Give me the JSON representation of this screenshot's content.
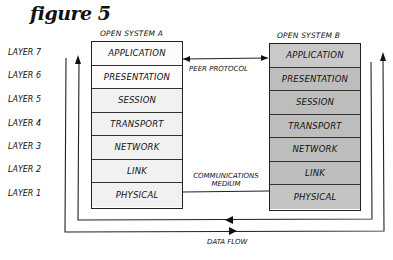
{
  "figure": {
    "title": "figure 5"
  },
  "systems": {
    "a": {
      "label": "OPEN SYSTEM A",
      "layers": [
        "APPLICATION",
        "PRESENTATION",
        "SESSION",
        "TRANSPORT",
        "NETWORK",
        "LINK",
        "PHYSICAL"
      ]
    },
    "b": {
      "label": "OPEN SYSTEM B",
      "layers": [
        "APPLICATION",
        "PRESENTATION",
        "SESSION",
        "TRANSPORT",
        "NETWORK",
        "LINK",
        "PHYSICAL"
      ]
    }
  },
  "layer_labels": [
    "LAYER 7",
    "LAYER 6",
    "LAYER 5",
    "LAYER 4",
    "LAYER 3",
    "LAYER 2",
    "LAYER 1"
  ],
  "connections": {
    "peer_protocol": "PEER PROTOCOL",
    "communications_medium_line1": "COMMUNICATIONS",
    "communications_medium_line2": "MEDIUM",
    "data_flow": "DATA FLOW"
  },
  "colors": {
    "system_a_fill": "#f1f1f1",
    "system_b_fill": "#bdbdbd",
    "ink": "#1a1a1a"
  }
}
